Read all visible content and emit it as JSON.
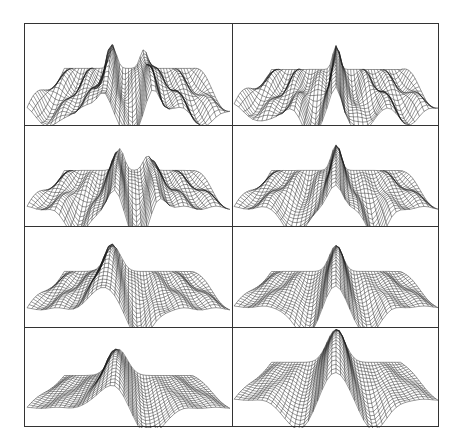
{
  "figure": {
    "rows": 4,
    "cols": 2,
    "line_color": "#1a1a1a",
    "border_color": "#333333",
    "panels": [
      {
        "row": 0,
        "col": 0,
        "baseline": 0.82,
        "plateau": 0.44,
        "peaks": [
          {
            "x": -0.12,
            "h": 0.28,
            "w": 0.03
          },
          {
            "x": 0.12,
            "h": 0.26,
            "w": 0.03
          }
        ],
        "troughs": [
          {
            "x": 0.0,
            "d": 0.35,
            "w": 0.05
          },
          {
            "x": -0.38,
            "d": 0.22,
            "w": 0.06
          },
          {
            "x": 0.38,
            "d": 0.2,
            "w": 0.06
          }
        ],
        "ripple": 0.08
      },
      {
        "row": 0,
        "col": 1,
        "baseline": 0.8,
        "plateau": 0.45,
        "peaks": [
          {
            "x": 0.0,
            "h": 0.33,
            "w": 0.025
          }
        ],
        "troughs": [
          {
            "x": -0.12,
            "d": 0.34,
            "w": 0.05
          },
          {
            "x": 0.12,
            "d": 0.34,
            "w": 0.05
          },
          {
            "x": -0.36,
            "d": 0.2,
            "w": 0.06
          },
          {
            "x": 0.36,
            "d": 0.2,
            "w": 0.06
          }
        ],
        "ripple": 0.08
      },
      {
        "row": 1,
        "col": 0,
        "baseline": 0.82,
        "plateau": 0.45,
        "peaks": [
          {
            "x": -0.07,
            "h": 0.3,
            "w": 0.035
          },
          {
            "x": 0.15,
            "h": 0.2,
            "w": 0.035
          }
        ],
        "troughs": [
          {
            "x": 0.05,
            "d": 0.38,
            "w": 0.05
          },
          {
            "x": -0.25,
            "d": 0.3,
            "w": 0.06
          }
        ],
        "ripple": 0.06
      },
      {
        "row": 1,
        "col": 1,
        "baseline": 0.82,
        "plateau": 0.45,
        "peaks": [
          {
            "x": 0.0,
            "h": 0.35,
            "w": 0.035
          }
        ],
        "troughs": [
          {
            "x": -0.2,
            "d": 0.34,
            "w": 0.05
          },
          {
            "x": 0.2,
            "d": 0.34,
            "w": 0.05
          }
        ],
        "ripple": 0.05
      },
      {
        "row": 2,
        "col": 0,
        "baseline": 0.82,
        "plateau": 0.45,
        "peaks": [
          {
            "x": -0.12,
            "h": 0.35,
            "w": 0.06
          }
        ],
        "troughs": [
          {
            "x": 0.06,
            "d": 0.33,
            "w": 0.06
          }
        ],
        "ripple": 0.04
      },
      {
        "row": 2,
        "col": 1,
        "baseline": 0.8,
        "plateau": 0.45,
        "peaks": [
          {
            "x": 0.0,
            "h": 0.36,
            "w": 0.05
          }
        ],
        "troughs": [
          {
            "x": -0.15,
            "d": 0.32,
            "w": 0.06
          },
          {
            "x": 0.15,
            "d": 0.32,
            "w": 0.06
          }
        ],
        "ripple": 0.03
      },
      {
        "row": 3,
        "col": 0,
        "baseline": 0.8,
        "plateau": 0.48,
        "peaks": [
          {
            "x": -0.08,
            "h": 0.36,
            "w": 0.07
          }
        ],
        "troughs": [
          {
            "x": 0.1,
            "d": 0.32,
            "w": 0.07
          }
        ],
        "ripple": 0.02
      },
      {
        "row": 3,
        "col": 1,
        "baseline": 0.72,
        "plateau": 0.35,
        "peaks": [
          {
            "x": 0.0,
            "h": 0.45,
            "w": 0.07
          }
        ],
        "troughs": [
          {
            "x": -0.18,
            "d": 0.34,
            "w": 0.07
          },
          {
            "x": 0.18,
            "d": 0.34,
            "w": 0.07
          }
        ],
        "ripple": 0.02
      }
    ]
  }
}
